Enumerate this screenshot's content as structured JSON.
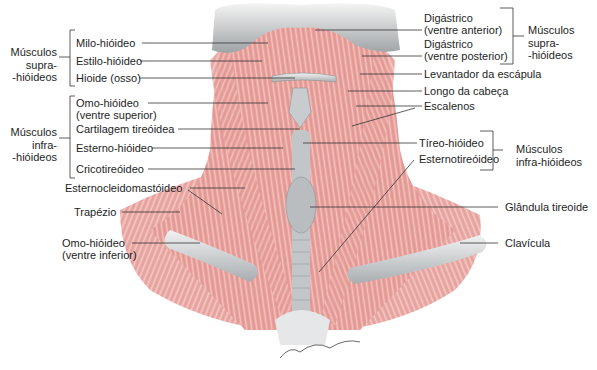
{
  "figure": {
    "colors": {
      "muscle": "#e9a4a0",
      "muscle_dark": "#d47c7a",
      "bone": "#cfd3d4",
      "bone_dark": "#9ea3a6",
      "leader_line": "#333333"
    }
  },
  "left_groups": {
    "supra": "Músculos supra- -hióideos",
    "supra_lines": [
      "Músculos",
      "supra-",
      "-hióideos"
    ],
    "infra_lines": [
      "Músculos",
      "infra-",
      "-hióideos"
    ]
  },
  "right_groups": {
    "supra_lines": [
      "Músculos",
      "supra-",
      "-hióideos"
    ],
    "infra_lines": [
      "Músculos",
      "infra-hióideos"
    ]
  },
  "labels_left": [
    {
      "text": "Milo-hióideo"
    },
    {
      "text": "Estilo-hióideo"
    },
    {
      "text": "Hioide (osso)"
    },
    {
      "text": "Omo-hióideo"
    },
    {
      "text": "(ventre superior)"
    },
    {
      "text": "Cartilagem tireóidea"
    },
    {
      "text": "Esterno-hióideo"
    },
    {
      "text": "Cricotireóideo"
    },
    {
      "text": "Esternocleidomastóideo"
    },
    {
      "text": "Trapézio"
    },
    {
      "text": "Omo-hióideo"
    },
    {
      "text": "(ventre inferior)"
    }
  ],
  "labels_right": [
    {
      "text": "Digástrico"
    },
    {
      "text": "(ventre anterior)"
    },
    {
      "text": "Digástrico"
    },
    {
      "text": "(ventre posterior)"
    },
    {
      "text": "Levantador da escápula"
    },
    {
      "text": "Longo da cabeça"
    },
    {
      "text": "Escalenos"
    },
    {
      "text": "Tíreo-hióideo"
    },
    {
      "text": "Esternotireóideo"
    },
    {
      "text": "Glândula tireoide"
    },
    {
      "text": "Clavícula"
    }
  ],
  "signature": "John V. Hagen"
}
